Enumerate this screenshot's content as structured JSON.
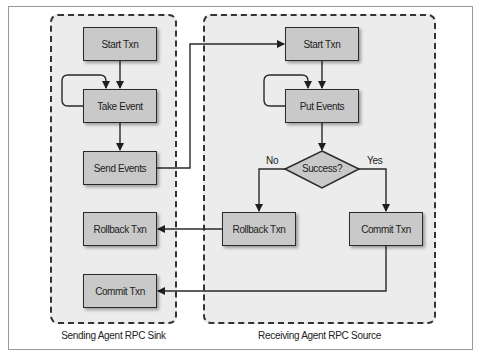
{
  "diagram": {
    "type": "flowchart",
    "colors": {
      "panel_fill": "#ececec",
      "box_fill": "#c9c9c9",
      "stroke": "#2a2a2a"
    },
    "panels": [
      {
        "id": "sink",
        "label": "Sending Agent RPC Sink",
        "nodes": [
          {
            "id": "sink_start",
            "label": "Start Txn"
          },
          {
            "id": "sink_take",
            "label": "Take Event"
          },
          {
            "id": "sink_send",
            "label": "Send Events"
          },
          {
            "id": "sink_rollback",
            "label": "Rollback Txn"
          },
          {
            "id": "sink_commit",
            "label": "Commit Txn"
          }
        ]
      },
      {
        "id": "source",
        "label": "Receiving Agent RPC Source",
        "nodes": [
          {
            "id": "src_start",
            "label": "Start Txn"
          },
          {
            "id": "src_put",
            "label": "Put Events"
          },
          {
            "id": "src_decision",
            "label": "Success?",
            "shape": "diamond"
          },
          {
            "id": "src_rollback",
            "label": "Rollback Txn"
          },
          {
            "id": "src_commit",
            "label": "Commit Txn"
          }
        ]
      }
    ],
    "edge_labels": {
      "no": "No",
      "yes": "Yes"
    },
    "edges": [
      {
        "from": "sink_start",
        "to": "sink_take"
      },
      {
        "from": "sink_take",
        "to": "sink_take",
        "kind": "loop"
      },
      {
        "from": "sink_take",
        "to": "sink_send"
      },
      {
        "from": "sink_send",
        "to": "src_start"
      },
      {
        "from": "src_start",
        "to": "src_put"
      },
      {
        "from": "src_put",
        "to": "src_put",
        "kind": "loop"
      },
      {
        "from": "src_put",
        "to": "src_decision"
      },
      {
        "from": "src_decision",
        "to": "src_rollback",
        "label": "No"
      },
      {
        "from": "src_decision",
        "to": "src_commit",
        "label": "Yes"
      },
      {
        "from": "src_rollback",
        "to": "sink_rollback"
      },
      {
        "from": "src_commit",
        "to": "sink_commit"
      }
    ]
  }
}
